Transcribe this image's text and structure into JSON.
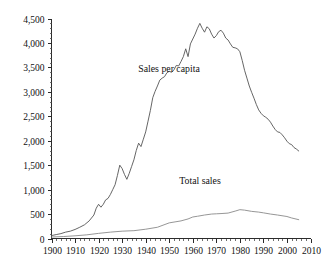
{
  "chart_data": {
    "type": "line",
    "title": "",
    "subtitle": "",
    "xlabel": "",
    "ylabel": "",
    "xlim": [
      1900,
      2010
    ],
    "ylim": [
      0,
      4500
    ],
    "grid": false,
    "legend_position": "inline-annotation",
    "x_tick_labels": [
      "1900",
      "1910",
      "1920",
      "1930",
      "1940",
      "1950",
      "1960",
      "1970",
      "1980",
      "1990",
      "2000",
      "2010"
    ],
    "x_tick_values": [
      1900,
      1910,
      1920,
      1930,
      1940,
      1950,
      1960,
      1970,
      1980,
      1990,
      2000,
      2010
    ],
    "x_minor_tick_step": 2,
    "y_tick_labels": [
      "0",
      "500",
      "1,000",
      "1,500",
      "2,000",
      "2,500",
      "3,000",
      "3,500",
      "4,000",
      "4,500"
    ],
    "y_tick_values": [
      0,
      500,
      1000,
      1500,
      2000,
      2500,
      3000,
      3500,
      4000,
      4500
    ],
    "y_minor_tick_step": 100,
    "series": [
      {
        "name": "Sales per capita",
        "color": "#555555",
        "annotation_label": "Sales per capita",
        "x": [
          1900,
          1902,
          1904,
          1906,
          1908,
          1910,
          1912,
          1914,
          1916,
          1918,
          1919,
          1920,
          1921,
          1922,
          1923,
          1924,
          1925,
          1926,
          1927,
          1928,
          1929,
          1930,
          1931,
          1932,
          1933,
          1934,
          1935,
          1936,
          1937,
          1938,
          1939,
          1940,
          1941,
          1942,
          1943,
          1944,
          1945,
          1946,
          1947,
          1948,
          1949,
          1950,
          1951,
          1952,
          1953,
          1954,
          1955,
          1956,
          1957,
          1958,
          1959,
          1960,
          1961,
          1962,
          1963,
          1964,
          1965,
          1966,
          1967,
          1968,
          1969,
          1970,
          1971,
          1972,
          1973,
          1974,
          1975,
          1976,
          1977,
          1978,
          1979,
          1980,
          1981,
          1982,
          1983,
          1984,
          1985,
          1986,
          1987,
          1988,
          1989,
          1990,
          1991,
          1992,
          1993,
          1994,
          1995,
          1996,
          1997,
          1998,
          1999,
          2000,
          2001,
          2002,
          2003,
          2004,
          2005
        ],
        "y": [
          60,
          80,
          100,
          130,
          150,
          185,
          230,
          280,
          360,
          480,
          620,
          700,
          640,
          700,
          790,
          820,
          900,
          1000,
          1100,
          1290,
          1500,
          1430,
          1310,
          1210,
          1330,
          1470,
          1610,
          1800,
          1950,
          1880,
          2030,
          2180,
          2400,
          2620,
          2880,
          3010,
          3120,
          3240,
          3280,
          3310,
          3390,
          3420,
          3400,
          3450,
          3540,
          3530,
          3620,
          3720,
          3880,
          3720,
          3980,
          4080,
          4180,
          4300,
          4400,
          4300,
          4220,
          4330,
          4290,
          4180,
          4100,
          4150,
          4230,
          4260,
          4200,
          4100,
          4060,
          3980,
          3910,
          3900,
          3880,
          3820,
          3640,
          3440,
          3280,
          3120,
          2990,
          2870,
          2740,
          2630,
          2560,
          2510,
          2480,
          2440,
          2380,
          2300,
          2230,
          2180,
          2170,
          2120,
          2060,
          1990,
          1940,
          1920,
          1860,
          1830,
          1790
        ]
      },
      {
        "name": "Total sales",
        "color": "#8a8a8a",
        "annotation_label": "Total sales",
        "x": [
          1900,
          1905,
          1910,
          1915,
          1920,
          1925,
          1930,
          1935,
          1940,
          1945,
          1950,
          1955,
          1958,
          1960,
          1962,
          1965,
          1968,
          1970,
          1972,
          1975,
          1978,
          1980,
          1982,
          1985,
          1988,
          1990,
          1993,
          1996,
          2000,
          2002,
          2005
        ],
        "y": [
          30,
          40,
          55,
          75,
          105,
          130,
          150,
          160,
          190,
          230,
          320,
          360,
          400,
          440,
          455,
          480,
          500,
          505,
          510,
          520,
          560,
          590,
          580,
          555,
          540,
          525,
          500,
          480,
          450,
          420,
          385
        ]
      }
    ],
    "annotations": [
      {
        "name": "sales-per-capita-label",
        "text": "Sales per capita",
        "x_px": 169,
        "y_px": 72
      },
      {
        "name": "total-sales-label",
        "text": "Total sales",
        "x_px": 200,
        "y_px": 184
      }
    ]
  }
}
